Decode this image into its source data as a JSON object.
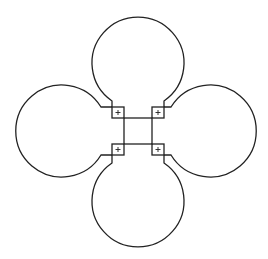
{
  "diagram": {
    "stroke_color": "#222222",
    "background": "#ffffff",
    "lobe_radius": 46,
    "lobes": [
      {
        "name": "top",
        "cx": 138,
        "cy": 63
      },
      {
        "name": "left",
        "cx": 62,
        "cy": 131
      },
      {
        "name": "right",
        "cx": 210,
        "cy": 131
      },
      {
        "name": "bottom",
        "cx": 138,
        "cy": 201
      }
    ],
    "center_square": {
      "x": 124,
      "y": 118,
      "w": 28,
      "h": 26
    },
    "corner_markers": [
      {
        "name": "top-left",
        "x": 112,
        "y": 107,
        "size": 12,
        "symbol": "+"
      },
      {
        "name": "top-right",
        "x": 152,
        "y": 107,
        "size": 12,
        "symbol": "+"
      },
      {
        "name": "bottom-left",
        "x": 112,
        "y": 144,
        "size": 12,
        "symbol": "+"
      },
      {
        "name": "bottom-right",
        "x": 152,
        "y": 144,
        "size": 12,
        "symbol": "+"
      }
    ]
  }
}
